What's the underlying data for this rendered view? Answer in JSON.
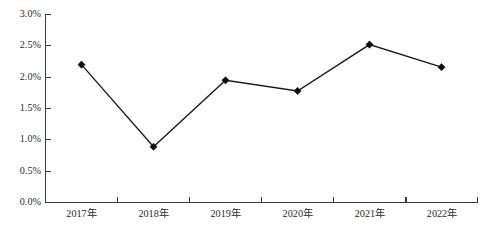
{
  "chart_data": {
    "type": "line",
    "title": "",
    "subtitle": "",
    "xlabel": "",
    "ylabel": "",
    "categories": [
      "2017年",
      "2018年",
      "2019年",
      "2020年",
      "2021年",
      "2022年"
    ],
    "values": [
      2.2,
      0.89,
      1.95,
      1.78,
      2.52,
      2.16
    ],
    "value_format": "percent",
    "ylim": [
      0.0,
      3.0
    ],
    "ytick_values": [
      0.0,
      0.5,
      1.0,
      1.5,
      2.0,
      2.5,
      3.0
    ],
    "ytick_labels": [
      "0.0%",
      "0.5%",
      "1.0%",
      "1.5%",
      "2.0%",
      "2.5%",
      "3.0%"
    ],
    "grid": false,
    "legend": null,
    "legend_position": "none",
    "series": [
      {
        "name": "",
        "values": [
          2.2,
          0.89,
          1.95,
          1.78,
          2.52,
          2.16
        ],
        "line_color": "#1a1a1a",
        "marker": "diamond",
        "marker_color": "#0d0d0d"
      }
    ],
    "annotations": []
  },
  "axes": {
    "y_axis_name": "y-axis",
    "x_axis_name": "x-axis",
    "axis_color": "#3a3a3a"
  },
  "colors": {
    "background": "#ffffff",
    "line": "#1a1a1a",
    "marker": "#0d0d0d",
    "axis": "#3a3a3a",
    "text": "#2b2b2b"
  }
}
